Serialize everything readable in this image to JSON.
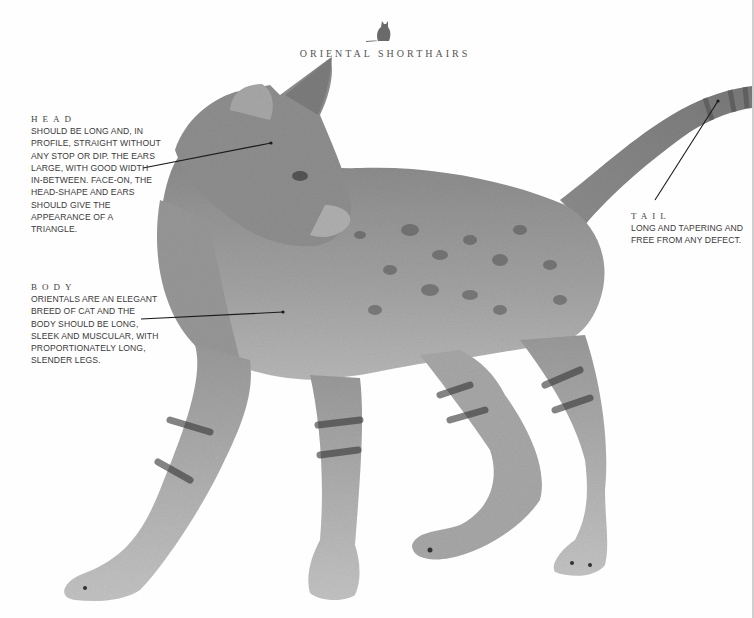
{
  "header": {
    "title": "Oriental Shorthairs",
    "logo_icon": "sitting-cat-silhouette-icon"
  },
  "annotations": [
    {
      "label": "HEAD",
      "text": "Should be long and, in profile, straight without any stop or dip. The ears large, with good width in-between. Face-on, the head-shape and ears should give the appearance of a triangle."
    },
    {
      "label": "BODY",
      "text": "Orientals are an elegant breed of cat and the body should be long, sleek and muscular, with proportionately long, slender legs."
    },
    {
      "label": "TAIL",
      "text": "Long and tapering and free from any defect."
    }
  ],
  "image": {
    "subject": "Spotted Oriental Shorthair cat, standing, head turned right",
    "palette": {
      "background": "#fefefe",
      "fur_light": "#b5b5b5",
      "fur_mid": "#8e8e8e",
      "fur_dark": "#4a4a4a",
      "leader_line": "#1a1a1a"
    }
  }
}
